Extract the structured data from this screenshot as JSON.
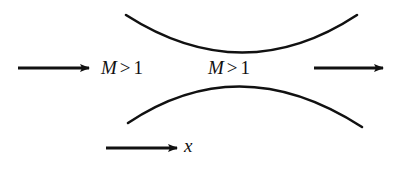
{
  "diagram": {
    "type": "converging-diverging nozzle flow",
    "stroke_color": "#111111",
    "background_color": "#ffffff",
    "walls": {
      "upper": {
        "start": [
          126,
          15
        ],
        "control": [
          243,
          90
        ],
        "end": [
          357,
          15
        ]
      },
      "lower": {
        "start": [
          128,
          123
        ],
        "control": [
          240,
          48
        ],
        "end": [
          362,
          127
        ]
      }
    },
    "inlet_label": {
      "variable": "M",
      "operator": ">",
      "value": "1"
    },
    "outlet_label": {
      "variable": "M",
      "operator": ">",
      "value": "1"
    },
    "inlet_arrow": {
      "from": [
        18,
        68
      ],
      "to": [
        89,
        68
      ]
    },
    "outlet_arrow": {
      "from": [
        314,
        68
      ],
      "to": [
        383,
        68
      ]
    },
    "axis_arrow": {
      "from": [
        106,
        148
      ],
      "to": [
        177,
        148
      ],
      "label": "x"
    }
  }
}
